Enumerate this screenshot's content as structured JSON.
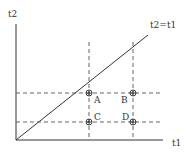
{
  "diagram": {
    "y_axis_label": "t2",
    "x_axis_label": "t1",
    "diagonal_label": "t2=t1",
    "points": [
      {
        "label": "A",
        "x": 89,
        "y": 93
      },
      {
        "label": "B",
        "x": 133,
        "y": 93
      },
      {
        "label": "C",
        "x": 89,
        "y": 122
      },
      {
        "label": "D",
        "x": 133,
        "y": 122
      }
    ],
    "colors": {
      "line": "#333333",
      "dashed": "#555555",
      "background": "#ffffff"
    }
  }
}
